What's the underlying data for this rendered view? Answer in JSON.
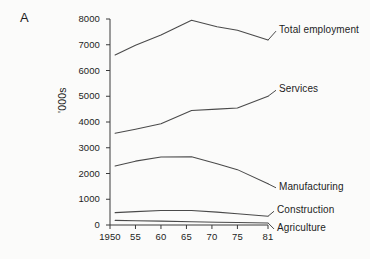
{
  "figure": {
    "panel_label": "A",
    "background_color": "#fbfbfa",
    "line_color": "#4a4a4a",
    "axis_color": "#3a3a3a"
  },
  "chart_data": {
    "type": "line",
    "title": "",
    "subtitle": "",
    "xlabel": "",
    "ylabel": "'000s",
    "xlim": [
      1950,
      1981
    ],
    "ylim": [
      0,
      8000
    ],
    "grid": false,
    "legend_position": "right-inline-labels",
    "x_tick_labels": [
      "1950",
      "55",
      "60",
      "65",
      "70",
      "75",
      "81"
    ],
    "x_tick_values": [
      1950,
      1955,
      1960,
      1965,
      1970,
      1975,
      1981
    ],
    "y_tick_labels": [
      "0",
      "1000",
      "2000",
      "3000",
      "4000",
      "5000",
      "6000",
      "7000",
      "8000"
    ],
    "y_tick_values": [
      0,
      1000,
      2000,
      3000,
      4000,
      5000,
      6000,
      7000,
      8000
    ],
    "series": [
      {
        "name": "Total employment",
        "label": "Total employment",
        "x": [
          1951,
          1955,
          1960,
          1966,
          1971,
          1975,
          1981
        ],
        "values": [
          6600,
          6980,
          7380,
          7950,
          7700,
          7560,
          7180
        ]
      },
      {
        "name": "Services",
        "label": "Services",
        "x": [
          1951,
          1955,
          1960,
          1966,
          1971,
          1975,
          1981
        ],
        "values": [
          3560,
          3720,
          3930,
          4450,
          4500,
          4540,
          5000
        ]
      },
      {
        "name": "Manufacturing",
        "label": "Manufacturing",
        "x": [
          1951,
          1955,
          1960,
          1966,
          1971,
          1975,
          1981
        ],
        "values": [
          2290,
          2480,
          2640,
          2650,
          2380,
          2150,
          1600
        ]
      },
      {
        "name": "Construction",
        "label": "Construction",
        "x": [
          1951,
          1955,
          1960,
          1966,
          1971,
          1975,
          1981
        ],
        "values": [
          480,
          520,
          560,
          560,
          500,
          440,
          340
        ]
      },
      {
        "name": "Agriculture",
        "label": "Agriculture",
        "x": [
          1951,
          1955,
          1960,
          1966,
          1971,
          1975,
          1981
        ],
        "values": [
          180,
          165,
          150,
          130,
          110,
          100,
          80
        ]
      }
    ]
  }
}
